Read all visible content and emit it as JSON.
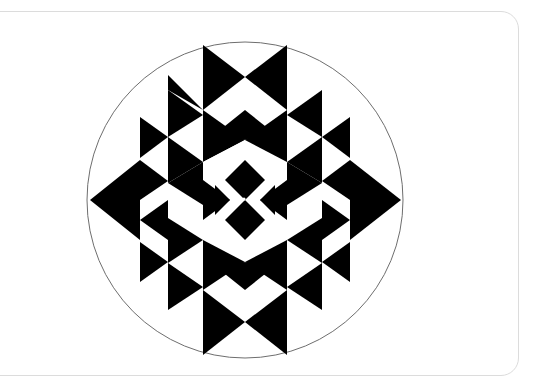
{
  "figure": {
    "colors": {
      "fill": "#000000",
      "background": "#ffffff",
      "circle_stroke": "#6e6e6e",
      "card_border": "#dcdcdc"
    },
    "circle": {
      "cx": 245,
      "cy": 200,
      "r": 158
    },
    "center_dot": {
      "cx": 244,
      "cy": 199,
      "r": 1.6
    }
  }
}
